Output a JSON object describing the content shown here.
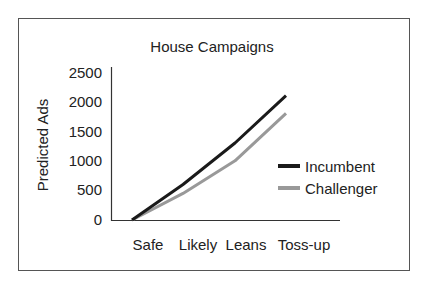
{
  "chart_data": {
    "type": "line",
    "title": "House Campaigns",
    "xlabel": "",
    "ylabel": "Predicted Ads",
    "categories": [
      "Safe",
      "Likely",
      "Leans",
      "Toss-up"
    ],
    "series": [
      {
        "name": "Incumbent",
        "values": [
          0,
          600,
          1300,
          2100
        ],
        "color": "#1a1a1a"
      },
      {
        "name": "Challenger",
        "values": [
          0,
          450,
          1000,
          1800
        ],
        "color": "#999999"
      }
    ],
    "ylim": [
      0,
      2500
    ],
    "yticks": [
      "0",
      "500",
      "1000",
      "1500",
      "2000",
      "2500"
    ],
    "grid": false,
    "legend_position": "right"
  },
  "labels": {
    "title": "House Campaigns",
    "ylabel": "Predicted Ads",
    "yticks": [
      "2500",
      "2000",
      "1500",
      "1000",
      "500",
      "0"
    ],
    "xticks": [
      "Safe",
      "Likely",
      "Leans",
      "Toss-up"
    ],
    "legend": [
      "Incumbent",
      "Challenger"
    ]
  }
}
